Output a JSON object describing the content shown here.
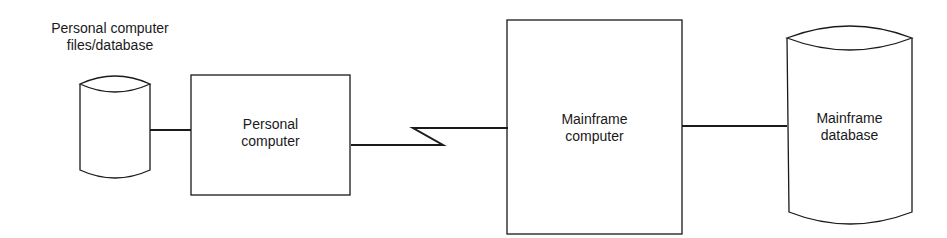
{
  "diagram": {
    "nodes": [
      {
        "id": "pc-files",
        "shape": "cylinder",
        "label": "Personal computer\nfiles/database"
      },
      {
        "id": "pc",
        "shape": "rectangle",
        "label": "Personal\ncomputer"
      },
      {
        "id": "mainframe",
        "shape": "rectangle",
        "label": "Mainframe\ncomputer"
      },
      {
        "id": "mainframe-db",
        "shape": "cylinder",
        "label": "Mainframe\ndatabase"
      }
    ],
    "edges": [
      {
        "from": "pc-files",
        "to": "pc",
        "style": "solid"
      },
      {
        "from": "pc",
        "to": "mainframe",
        "style": "communication-link-zigzag"
      },
      {
        "from": "mainframe",
        "to": "mainframe-db",
        "style": "solid"
      }
    ],
    "colors": {
      "stroke": "#1a1a1a",
      "background": "#ffffff"
    }
  }
}
